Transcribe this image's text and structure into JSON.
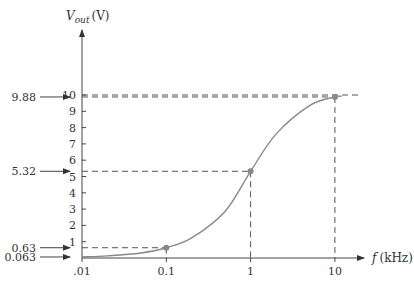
{
  "chart_data": {
    "type": "line",
    "title": "",
    "xlabel": "f (kHz)",
    "ylabel": "V_out (V)",
    "ylabel_main": "V",
    "ylabel_sub": "out",
    "ylabel_unit": "(V)",
    "xlabel_var": "f",
    "xlabel_unit": "(kHz)",
    "x_scale": "log",
    "x_ticks": [
      ".01",
      "0.1",
      "1",
      "10"
    ],
    "y_ticks": [
      "1",
      "2",
      "3",
      "4",
      "5",
      "6",
      "7",
      "8",
      "9",
      "10"
    ],
    "ylim": [
      0,
      10
    ],
    "xlim": [
      0.01,
      10
    ],
    "grid": false,
    "series": [
      {
        "name": "V_out",
        "x": [
          0.01,
          0.02,
          0.05,
          0.1,
          0.2,
          0.5,
          1,
          2,
          5,
          10,
          12
        ],
        "values": [
          0.063,
          0.13,
          0.31,
          0.63,
          1.23,
          2.87,
          5.32,
          7.6,
          9.35,
          9.88,
          9.92
        ]
      }
    ],
    "marked_points": [
      {
        "f": 0.1,
        "v": 0.63
      },
      {
        "f": 1,
        "v": 5.32
      },
      {
        "f": 10,
        "v": 9.88
      }
    ],
    "annotations": [
      {
        "text": "9.88",
        "value": 9.88
      },
      {
        "text": "5.32",
        "value": 5.32
      },
      {
        "text": "0.63",
        "value": 0.63
      },
      {
        "text": "0.063",
        "value": 0.063
      }
    ],
    "reference_line": {
      "value": 10
    }
  }
}
